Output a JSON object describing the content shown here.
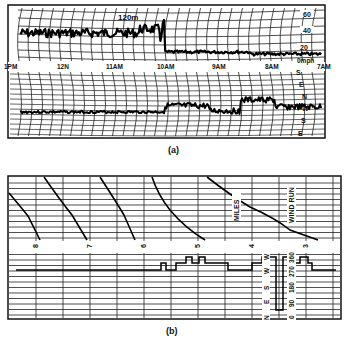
{
  "figure": {
    "panel_a": {
      "caption": "(a)",
      "height_label": "120m",
      "time_labels": [
        "1PM",
        "12N",
        "11AM",
        "10AM",
        "9AM",
        "8AM",
        "7AM"
      ],
      "speed_scale": [
        "60",
        "40",
        "20",
        "0mph"
      ],
      "direction_scale": [
        "S",
        "E",
        "N",
        "W",
        "S",
        "E"
      ]
    },
    "panel_b": {
      "caption": "(b)",
      "miles_label": "MILES",
      "wind_run_label": "WIND RUN",
      "hour_labels": [
        "8",
        "7",
        "6",
        "5",
        "4",
        "3"
      ],
      "direction_letters": [
        "W",
        "W",
        "S",
        "E",
        "N"
      ],
      "degree_labels": [
        "360",
        "270",
        "180",
        "90",
        "0"
      ]
    }
  },
  "chart_data": [
    {
      "type": "line",
      "title": "Wind speed at 120m (strip chart)",
      "panel": "(a) upper trace",
      "x": [
        "1PM",
        "12N",
        "11AM",
        "10AM",
        "9AM",
        "8AM",
        "7AM"
      ],
      "series": [
        {
          "name": "wind speed (mph)",
          "values": [
            35,
            33,
            32,
            38,
            8,
            5,
            6
          ]
        }
      ],
      "ylabel": "mph",
      "ylim": [
        0,
        60
      ],
      "yticks": [
        0,
        20,
        40,
        60
      ],
      "grid": true
    },
    {
      "type": "line",
      "title": "Wind direction at 120m (strip chart)",
      "panel": "(a) lower trace",
      "x": [
        "1PM",
        "12N",
        "11AM",
        "10AM",
        "9AM",
        "8AM",
        "7AM"
      ],
      "series": [
        {
          "name": "wind direction",
          "values": [
            "W",
            "W",
            "W",
            "W-N",
            "W",
            "N",
            "W"
          ]
        }
      ],
      "yticks": [
        "S",
        "E",
        "N",
        "W",
        "S",
        "E"
      ],
      "grid": true
    },
    {
      "type": "line",
      "title": "Wind run (miles) and wind direction",
      "panel": "(b)",
      "x_hour_marks": [
        "8",
        "7",
        "6",
        "5",
        "4",
        "3"
      ],
      "series": [
        {
          "name": "wind run (miles) pen traces",
          "values": "sawtooth descending traces between hour marks"
        },
        {
          "name": "wind direction (step trace)",
          "values": [
            "W",
            "W",
            "W",
            "W",
            "N-W",
            "W",
            "W",
            "W",
            "N",
            "W",
            "W"
          ]
        }
      ],
      "ylabels_direction": [
        "N",
        "E",
        "S",
        "W",
        "N"
      ],
      "ylabels_degrees": [
        "0",
        "90",
        "180",
        "270",
        "360"
      ],
      "grid": true
    }
  ]
}
